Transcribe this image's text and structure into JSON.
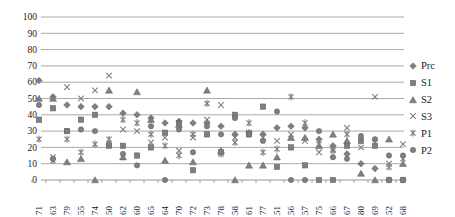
{
  "chart_data": {
    "type": "scatter",
    "title": "",
    "xlabel": "",
    "ylabel": "",
    "ylim": [
      0,
      100
    ],
    "yticks": [
      0,
      10,
      20,
      30,
      40,
      50,
      60,
      70,
      80,
      90,
      100
    ],
    "grid": "horizontal",
    "legend_position": "right",
    "marker_color": "#7f7f7f",
    "marker_edge_color": "#606060",
    "gridline_color": "#a0a0a0",
    "axis_color": "#8c8c8c",
    "text_color": "#1a1a1a",
    "categories": [
      "171",
      "163",
      "179",
      "155",
      "174",
      "150",
      "162",
      "160",
      "165",
      "164",
      "170",
      "172",
      "173",
      "178",
      "158",
      "161",
      "177",
      "151",
      "156",
      "157",
      "175",
      "166",
      "167",
      "180",
      "169",
      "152",
      "168"
    ],
    "series": [
      {
        "name": "Prc",
        "marker": "diamond",
        "values": [
          61,
          51,
          46,
          45,
          45,
          45,
          41,
          40,
          38,
          35,
          36,
          35,
          35,
          33,
          28,
          29,
          28,
          32,
          33,
          32,
          25,
          21,
          16,
          10,
          7,
          0,
          0
        ]
      },
      {
        "name": "S1",
        "marker": "square",
        "values": [
          37,
          44,
          30,
          37,
          40,
          21,
          21,
          15,
          20,
          29,
          35,
          6,
          28,
          17,
          40,
          28,
          45,
          8,
          20,
          9,
          0,
          0,
          21,
          24,
          21,
          0,
          0
        ]
      },
      {
        "name": "S2",
        "marker": "triangle",
        "values": [
          50,
          50,
          11,
          13,
          0,
          55,
          14,
          54,
          37,
          12,
          34,
          11,
          55,
          18,
          0,
          9,
          9,
          14,
          26,
          26,
          21,
          28,
          24,
          4,
          0,
          25,
          10
        ]
      },
      {
        "name": "S3",
        "marker": "x",
        "values": [
          37,
          14,
          57,
          50,
          55,
          64,
          31,
          30,
          23,
          26,
          18,
          26,
          37,
          46,
          26,
          29,
          26,
          24,
          28,
          24,
          17,
          19,
          32,
          20,
          51,
          10,
          22
        ]
      },
      {
        "name": "P1",
        "marker": "asterisk",
        "values": [
          25,
          12,
          25,
          17,
          22,
          25,
          37,
          35,
          28,
          21,
          15,
          28,
          47,
          16,
          23,
          35,
          17,
          19,
          51,
          35,
          22,
          18,
          28,
          24,
          23,
          8,
          13
        ]
      },
      {
        "name": "P2",
        "marker": "circle",
        "values": [
          46,
          13,
          30,
          31,
          30,
          22,
          16,
          9,
          33,
          0,
          31,
          17,
          33,
          28,
          38,
          28,
          24,
          42,
          0,
          0,
          30,
          14,
          13,
          27,
          25,
          15,
          15
        ]
      }
    ]
  }
}
